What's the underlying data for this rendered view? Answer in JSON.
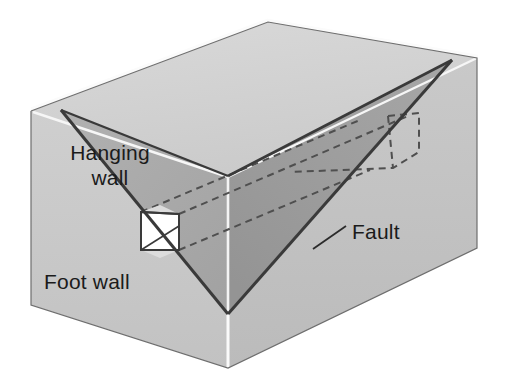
{
  "figure": {
    "type": "geologic-block-diagram",
    "background_color": "#ffffff"
  },
  "labels": {
    "hanging_wall_line1": "Hanging",
    "hanging_wall_line2": "wall",
    "foot_wall": "Foot wall",
    "fault": "Fault"
  },
  "colors": {
    "top_face": "#d2d2d2",
    "front_left_face": "#c9c9c9",
    "front_right_face": "#c2c2c2",
    "fault_plane_left": "#a8a8a8",
    "fault_plane_right": "#9c9c9c",
    "outline": "#3a3a3a",
    "highlight": "#fbfbfb",
    "dashed": "#555555",
    "marker_block_face": "#ffffff",
    "marker_block_shade": "#e8e8e8",
    "text": "#1b1b1b"
  },
  "geometry": {
    "box_corners": {
      "top_back": [
        268,
        22
      ],
      "top_left": [
        31,
        111
      ],
      "top_right": [
        477,
        58
      ],
      "front_top": [
        228,
        176
      ],
      "front_bottom": [
        228,
        368
      ],
      "bottom_left": [
        31,
        305
      ],
      "bottom_right": [
        477,
        248
      ]
    },
    "fault_triangle": {
      "left_apex": [
        61,
        110
      ],
      "right_apex": [
        452,
        60
      ],
      "bottom_apex": [
        228,
        314
      ]
    },
    "marker_block": {
      "x": 141,
      "y": 212,
      "width": 38,
      "height": 38
    },
    "fault_leader_line": {
      "from": [
        313,
        248
      ],
      "to": [
        345,
        226
      ]
    }
  }
}
